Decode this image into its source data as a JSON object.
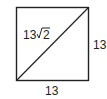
{
  "diagram": {
    "type": "square-with-diagonal",
    "side_label_right": "13",
    "side_label_bottom": "13",
    "diagonal_label_coef": "13",
    "diagonal_label_radicand": "2",
    "diagonal_label_full": "13√2",
    "stroke_color": "#222222"
  }
}
